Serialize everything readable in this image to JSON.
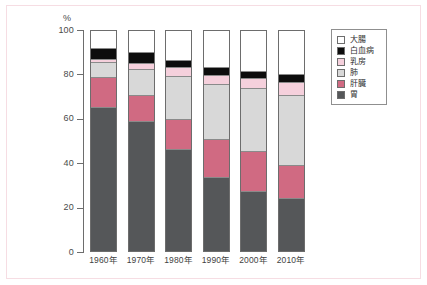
{
  "frame": {
    "border_color": "#f6dde3",
    "background": "#ffffff"
  },
  "axis": {
    "y_unit_label": "%",
    "y_ticks": [
      "100",
      "80",
      "60",
      "40",
      "20",
      "0"
    ],
    "y_min": 0,
    "y_max": 100,
    "axis_color": "#6d6d6d"
  },
  "legend": {
    "position": "right",
    "entries": [
      {
        "label": "大腸",
        "color": "#ffffff",
        "key": "colon"
      },
      {
        "label": "白血病",
        "color": "#0d0d0d",
        "key": "leukemia"
      },
      {
        "label": "乳房",
        "color": "#f5d0dc",
        "key": "breast"
      },
      {
        "label": "肺",
        "color": "#d8d8d8",
        "key": "lung"
      },
      {
        "label": "肝臓",
        "color": "#d06a82",
        "key": "liver"
      },
      {
        "label": "胃",
        "color": "#555759",
        "key": "stomach"
      }
    ]
  },
  "chart_data": {
    "type": "bar",
    "stacked": true,
    "stack_mode": "percent",
    "title": "",
    "subtitle": "",
    "xlabel": "",
    "ylabel": "%",
    "ylim": [
      0,
      100
    ],
    "yticks": [
      0,
      20,
      40,
      60,
      80,
      100
    ],
    "grid": false,
    "legend_position": "right",
    "categories": [
      "1960年",
      "1970年",
      "1980年",
      "1990年",
      "2000年",
      "2010年"
    ],
    "series": [
      {
        "name": "胃",
        "color": "#555759",
        "values": [
          65.0,
          58.5,
          46.0,
          33.0,
          27.0,
          23.5
        ]
      },
      {
        "name": "肝臓",
        "color": "#d06a82",
        "values": [
          13.5,
          12.0,
          13.5,
          17.5,
          18.0,
          15.0
        ]
      },
      {
        "name": "肺",
        "color": "#d8d8d8",
        "values": [
          7.0,
          12.0,
          19.5,
          25.0,
          28.5,
          32.0
        ]
      },
      {
        "name": "乳房",
        "color": "#f5d0dc",
        "values": [
          1.5,
          2.5,
          4.0,
          4.0,
          4.5,
          6.0
        ]
      },
      {
        "name": "白血病",
        "color": "#0d0d0d",
        "values": [
          5.0,
          5.0,
          3.5,
          3.5,
          3.5,
          3.5
        ]
      },
      {
        "name": "大腸",
        "color": "#ffffff",
        "values": [
          8.0,
          10.0,
          13.5,
          17.0,
          18.5,
          20.0
        ]
      }
    ]
  }
}
